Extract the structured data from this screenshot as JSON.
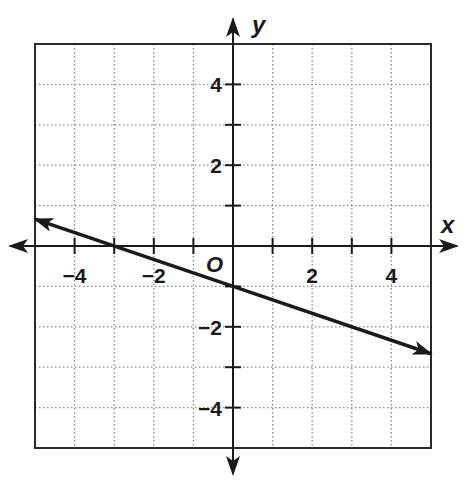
{
  "chart_data": {
    "type": "line",
    "title": "",
    "xlabel": "x",
    "ylabel": "y",
    "origin_label": "O",
    "xlim": [
      -5,
      5
    ],
    "ylim": [
      -5,
      5
    ],
    "grid": true,
    "grid_style": "dotted",
    "x_ticks": [
      -4,
      -3,
      -2,
      -1,
      1,
      2,
      3,
      4
    ],
    "y_ticks": [
      -4,
      -3,
      -2,
      -1,
      1,
      2,
      3,
      4
    ],
    "x_tick_labels": [
      {
        "value": -4,
        "text": "−4"
      },
      {
        "value": -2,
        "text": "−2"
      },
      {
        "value": 2,
        "text": "2"
      },
      {
        "value": 4,
        "text": "4"
      }
    ],
    "y_tick_labels": [
      {
        "value": 4,
        "text": "4"
      },
      {
        "value": 2,
        "text": "2"
      },
      {
        "value": -2,
        "text": "−2"
      },
      {
        "value": -4,
        "text": "−4"
      }
    ],
    "series": [
      {
        "name": "line",
        "slope": -0.3333,
        "intercept": -1,
        "x": [
          -5,
          -3,
          0,
          5
        ],
        "y": [
          0.667,
          0,
          -1,
          -2.667
        ],
        "arrows_both_ends": true
      }
    ],
    "colors": {
      "ink": "#1a1a1a",
      "grid": "#8a8a8a",
      "background": "#ffffff"
    }
  }
}
